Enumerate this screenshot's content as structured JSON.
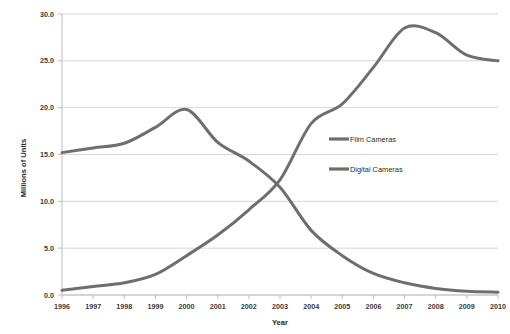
{
  "chart_data": {
    "type": "line",
    "title": "",
    "xlabel": "Year",
    "ylabel": "Millions of Units",
    "categories": [
      "1996",
      "1997",
      "1998",
      "1999",
      "2000",
      "2001",
      "2002",
      "2003",
      "2004",
      "2005",
      "2006",
      "2007",
      "2008",
      "2009",
      "2010"
    ],
    "x": [
      1996,
      1997,
      1998,
      1999,
      2000,
      2001,
      2002,
      2003,
      2004,
      2005,
      2006,
      2007,
      2008,
      2009,
      2010
    ],
    "series": [
      {
        "name": "Film Cameras",
        "color": "#6e6e6e",
        "values": [
          15.2,
          15.7,
          16.2,
          17.9,
          19.8,
          16.3,
          14.3,
          11.5,
          6.9,
          4.2,
          2.3,
          1.3,
          0.7,
          0.4,
          0.3
        ]
      },
      {
        "name": "Digital Cameras",
        "color": "#6e6e6e",
        "values": [
          0.5,
          0.9,
          1.3,
          2.2,
          4.2,
          6.4,
          9.1,
          12.3,
          18.3,
          20.4,
          24.3,
          28.5,
          28.0,
          25.6,
          25.0
        ]
      }
    ],
    "ylim": [
      0.0,
      30.0
    ],
    "yticks": [
      0.0,
      5.0,
      10.0,
      15.0,
      20.0,
      25.0,
      30.0
    ],
    "ytick_labels": [
      "0.0",
      "5.0",
      "10.0",
      "15.0",
      "20.0",
      "25.0",
      "30.0"
    ],
    "grid": true,
    "grid_axis": "y",
    "grid_color": "#d6d6d6",
    "legend_position": "inside-center-right",
    "legend_entries": [
      "Film Cameras",
      "Digital Cameras"
    ],
    "axis_line_color": "#bfbfbf",
    "plot_background": "#ffffff"
  },
  "axes": {
    "y_title": "Millions of Units",
    "x_title": "Year"
  },
  "legend": {
    "items": [
      {
        "label": "Film Cameras"
      },
      {
        "label": "Digital Cameras"
      }
    ]
  },
  "cropped_header": {
    "text": ""
  }
}
